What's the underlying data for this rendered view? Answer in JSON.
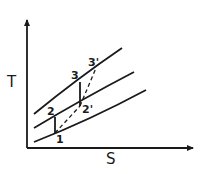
{
  "diagram": {
    "type": "T-s diagram",
    "axes": {
      "y_label": "T",
      "x_label": "S"
    },
    "curves": [
      {
        "name": "upper-isobar",
        "from": [
          34,
          114
        ],
        "ctrl": [
          78,
          78
        ],
        "to": [
          122,
          48
        ]
      },
      {
        "name": "middle-isobar",
        "from": [
          34,
          128
        ],
        "ctrl": [
          84,
          98
        ],
        "to": [
          134,
          72
        ]
      },
      {
        "name": "lower-isobar",
        "from": [
          34,
          142
        ],
        "ctrl": [
          90,
          120
        ],
        "to": [
          146,
          90
        ]
      }
    ],
    "points": [
      {
        "id": "1",
        "label": "1",
        "x": 55,
        "y": 133
      },
      {
        "id": "2",
        "label": "2",
        "x": 55,
        "y": 117
      },
      {
        "id": "2p",
        "label": "2'",
        "x": 80,
        "y": 106
      },
      {
        "id": "3",
        "label": "3",
        "x": 80,
        "y": 82
      },
      {
        "id": "3p",
        "label": "3'",
        "x": 96,
        "y": 68
      }
    ],
    "solid_segments": [
      {
        "from": "1",
        "to": "2"
      },
      {
        "from": "2p",
        "to": "3"
      }
    ],
    "dashed_segments": [
      {
        "from": "1",
        "to": "2p"
      },
      {
        "from": "2p",
        "to": "3p"
      }
    ],
    "colors": {
      "stroke": "#1a1a1a",
      "background": "#ffffff"
    }
  }
}
